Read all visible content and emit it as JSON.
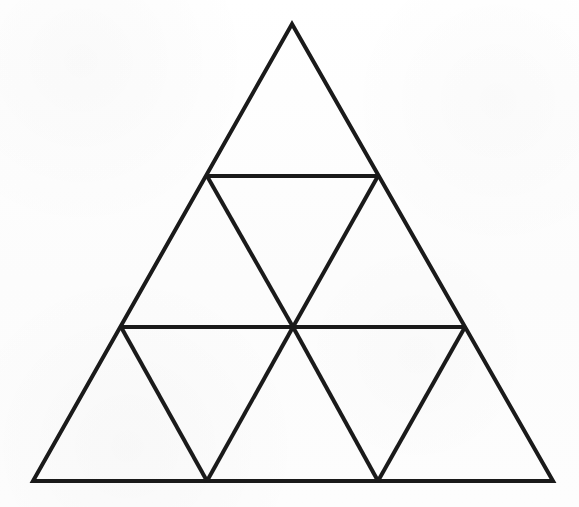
{
  "figure": {
    "canvas": {
      "width": 579,
      "height": 507
    },
    "style": {
      "background_color": "#fdfdfd",
      "line_color": "#1a1a1a",
      "line_width": 4,
      "fill": "none"
    },
    "geometry": {
      "subdivision_rows": 3,
      "small_triangles_total": 9,
      "upward_triangles": 6,
      "downward_triangles": 3,
      "vertices": {
        "apex": {
          "label": "apex",
          "x": 292,
          "y": 24
        },
        "bottom_left": {
          "label": "bottom-left",
          "x": 33,
          "y": 481
        },
        "bottom_right": {
          "label": "bottom-right",
          "x": 553,
          "y": 481
        },
        "left_edge_row1": {
          "label": "left-edge-upper",
          "x": 207,
          "y": 176
        },
        "right_edge_row1": {
          "label": "right-edge-upper",
          "x": 378,
          "y": 176
        },
        "left_edge_row2": {
          "label": "left-edge-lower",
          "x": 121,
          "y": 327
        },
        "right_edge_row2": {
          "label": "right-edge-lower",
          "x": 465,
          "y": 327
        },
        "center": {
          "label": "center-crossing",
          "x": 293,
          "y": 327
        },
        "base_left_v": {
          "label": "base-left-vertex",
          "x": 207,
          "y": 481
        },
        "base_right_v": {
          "label": "base-right-vertex",
          "x": 378,
          "y": 481
        }
      },
      "outline_path": "M 292 24 L 553 481 L 33 481 Z",
      "interior_lines": [
        {
          "name": "horizontal-upper",
          "x1": 207,
          "y1": 176,
          "x2": 378,
          "y2": 176
        },
        {
          "name": "horizontal-lower",
          "x1": 121,
          "y1": 327,
          "x2": 465,
          "y2": 327
        },
        {
          "name": "left-leaning-upper",
          "x1": 207,
          "y1": 176,
          "x2": 293,
          "y2": 327
        },
        {
          "name": "right-leaning-upper",
          "x1": 378,
          "y1": 176,
          "x2": 293,
          "y2": 327
        },
        {
          "name": "left-leaning-lower",
          "x1": 121,
          "y1": 327,
          "x2": 207,
          "y2": 481
        },
        {
          "name": "right-leaning-lower-left",
          "x1": 293,
          "y1": 327,
          "x2": 207,
          "y2": 481
        },
        {
          "name": "left-leaning-lower-right",
          "x1": 293,
          "y1": 327,
          "x2": 378,
          "y2": 481
        },
        {
          "name": "right-leaning-lower-far",
          "x1": 465,
          "y1": 327,
          "x2": 378,
          "y2": 481
        }
      ]
    }
  }
}
